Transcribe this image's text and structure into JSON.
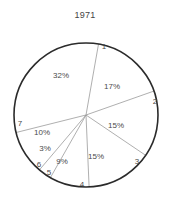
{
  "chart_data": {
    "type": "pie",
    "title": "1971",
    "xlabel": "",
    "ylabel": "",
    "legend": "none",
    "grid": false,
    "categories": [
      "1",
      "2",
      "3",
      "4",
      "5",
      "6",
      "7"
    ],
    "values": [
      17,
      15,
      15,
      9,
      3,
      10,
      32
    ],
    "value_labels": [
      "17%",
      "15%",
      "15%",
      "9%",
      "3%",
      "10%",
      "32%"
    ],
    "slice_labels": [
      "1",
      "2",
      "3",
      "4",
      "5",
      "6",
      "7"
    ],
    "units": "percent",
    "total": 101,
    "start_angle_deg": -80,
    "direction": "clockwise",
    "colors": {
      "slice_fill": "#ffffff",
      "outline": "#2b2b2b",
      "divider": "#9a9a9a",
      "text": "#4a4a4a",
      "background": "#ffffff"
    },
    "geometry": {
      "center_x": 86,
      "center_y": 115,
      "radius": 72
    }
  },
  "labels": {
    "pct": [
      {
        "text": "17%",
        "x": 112,
        "y": 87
      },
      {
        "text": "15%",
        "x": 116,
        "y": 126
      },
      {
        "text": "15%",
        "x": 96,
        "y": 157
      },
      {
        "text": "9%",
        "x": 62,
        "y": 162
      },
      {
        "text": "3%",
        "x": 45,
        "y": 149
      },
      {
        "text": "10%",
        "x": 42,
        "y": 133
      },
      {
        "text": "32%",
        "x": 61,
        "y": 76
      }
    ],
    "index": [
      {
        "text": "1",
        "x": 104,
        "y": 47
      },
      {
        "text": "2",
        "x": 155,
        "y": 102
      },
      {
        "text": "3",
        "x": 137,
        "y": 162
      },
      {
        "text": "4",
        "x": 82,
        "y": 185
      },
      {
        "text": "5",
        "x": 49,
        "y": 173
      },
      {
        "text": "6",
        "x": 39,
        "y": 165
      },
      {
        "text": "7",
        "x": 20,
        "y": 124
      }
    ]
  }
}
